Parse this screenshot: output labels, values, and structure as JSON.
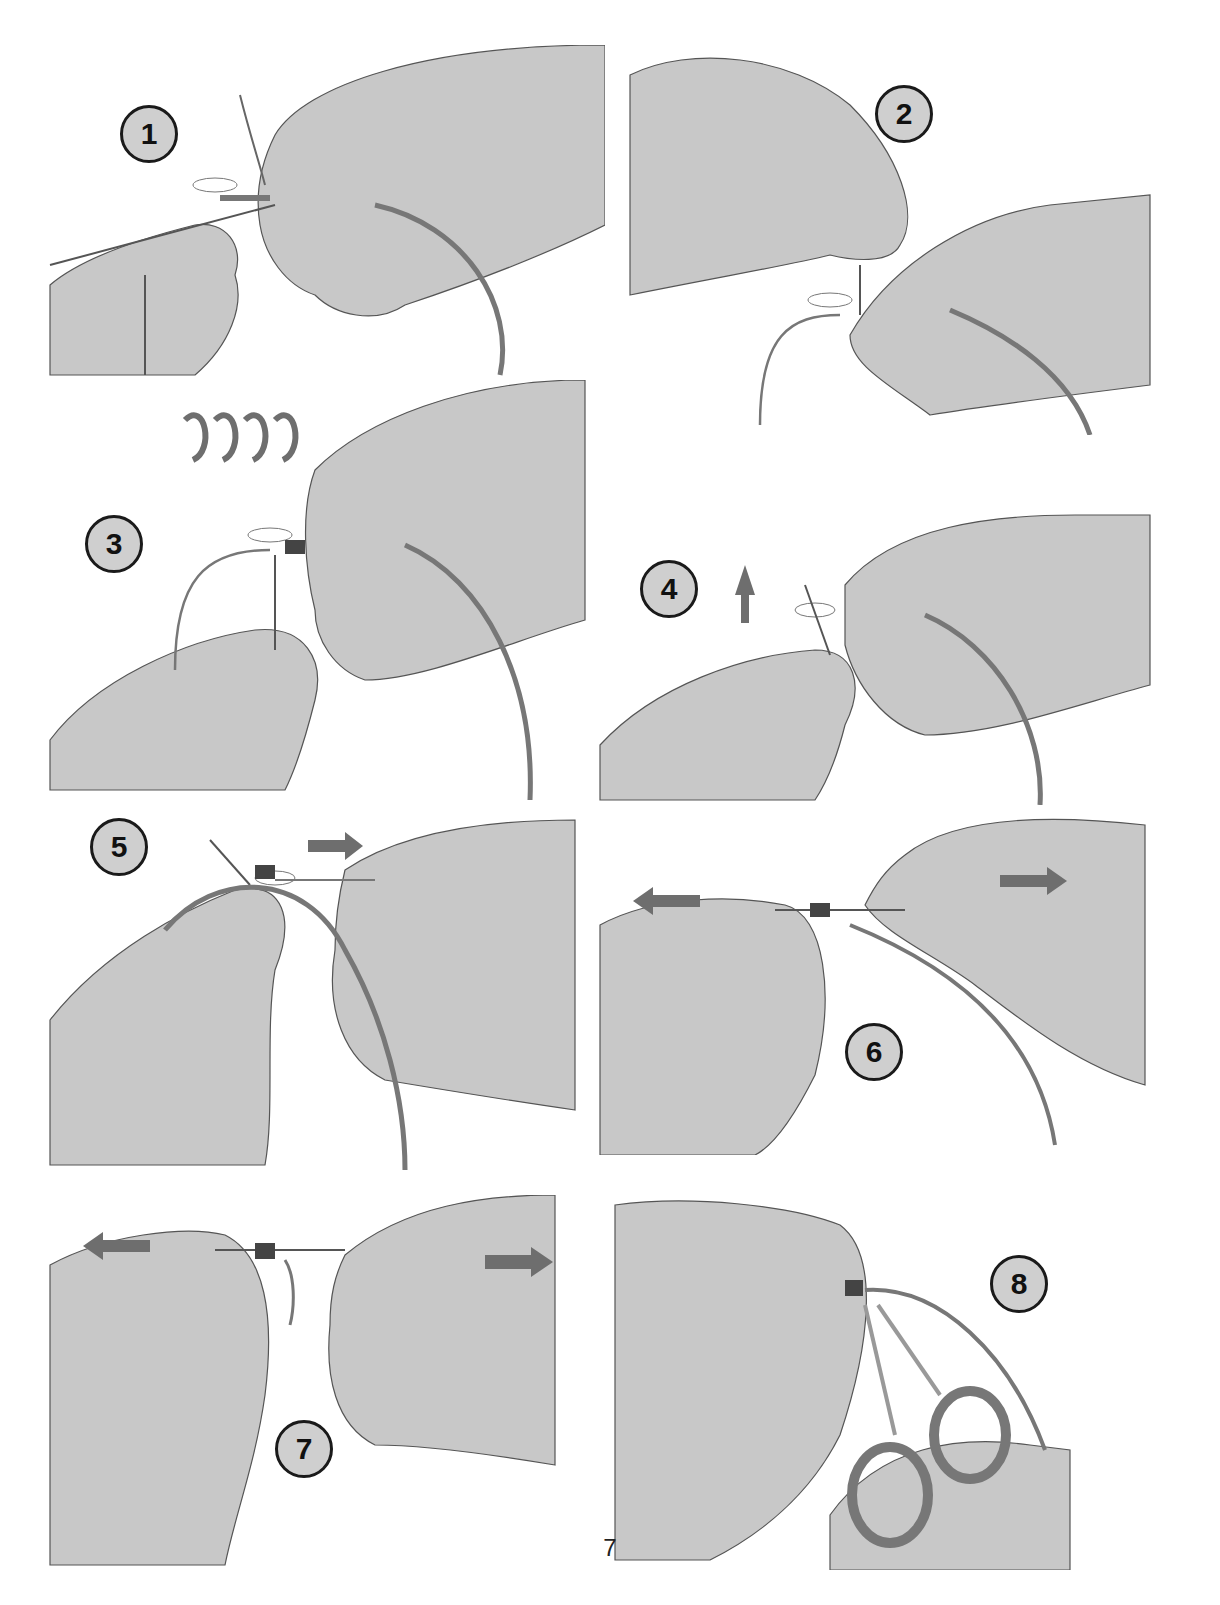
{
  "document": {
    "title_fragment": "",
    "page_number": "7"
  },
  "colors": {
    "hand_fill": "#c8c8c8",
    "hand_stroke": "#555555",
    "line_color": "#777777",
    "arrow_color": "#6e6e6e",
    "badge_fill": "#cfcfcf",
    "badge_border": "#1a1a1a"
  },
  "steps": [
    {
      "number": "1",
      "arrows": []
    },
    {
      "number": "2",
      "arrows": []
    },
    {
      "number": "3",
      "arrows": [
        "wrap-arrows-x4"
      ]
    },
    {
      "number": "4",
      "arrows": [
        "arrow-up"
      ]
    },
    {
      "number": "5",
      "arrows": [
        "arrow-right"
      ]
    },
    {
      "number": "6",
      "arrows": [
        "arrow-left",
        "arrow-right"
      ]
    },
    {
      "number": "7",
      "arrows": [
        "arrow-left",
        "arrow-right"
      ]
    },
    {
      "number": "8",
      "arrows": [],
      "tool": "scissors"
    }
  ]
}
